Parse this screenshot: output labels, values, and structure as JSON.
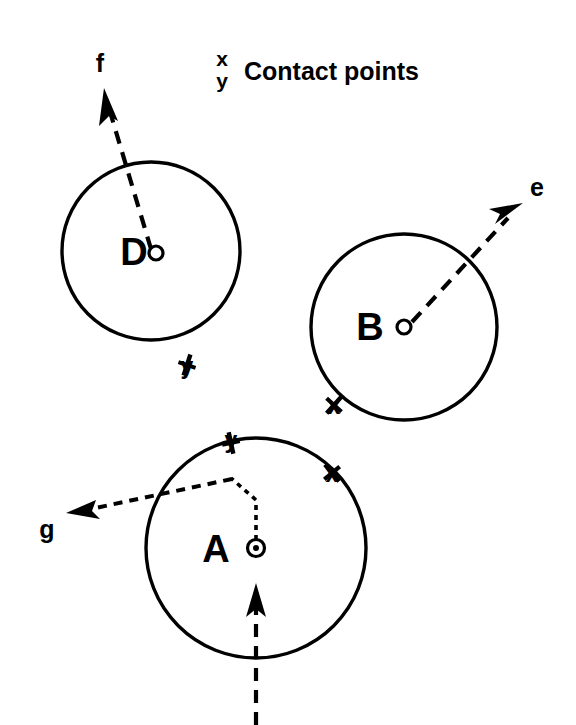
{
  "figure": {
    "background_color": "#ffffff",
    "ink_color": "#000000",
    "legend": {
      "key_x": "x",
      "key_y": "y",
      "caption": "Contact points"
    },
    "bodies": [
      {
        "id": "body-d",
        "label": "D",
        "center": {
          "x": 151,
          "y": 251
        },
        "radius": 89,
        "center_marker": "open-circle",
        "contact_marks": [
          {
            "label": "y",
            "x": 187,
            "y": 365
          }
        ],
        "force": {
          "label": "f",
          "label_x": 100,
          "label_y": 68,
          "from": {
            "x": 151,
            "y": 249
          },
          "to": {
            "x": 105,
            "y": 92
          },
          "style": "dashed"
        }
      },
      {
        "id": "body-b",
        "label": "B",
        "center": {
          "x": 404,
          "y": 327
        },
        "radius": 93,
        "center_marker": "open-circle",
        "contact_marks": [
          {
            "label": "x",
            "x": 334,
            "y": 405
          }
        ],
        "force": {
          "label": "e",
          "label_x": 537,
          "label_y": 194,
          "from": {
            "x": 406,
            "y": 326
          },
          "to": {
            "x": 521,
            "y": 206
          },
          "style": "dashed"
        }
      },
      {
        "id": "body-a",
        "label": "A",
        "center": {
          "x": 256,
          "y": 548
        },
        "radius": 110,
        "center_marker": "circle-with-dot",
        "contact_marks": [
          {
            "label": "y",
            "x": 231,
            "y": 444
          },
          {
            "label": "x",
            "x": 332,
            "y": 474
          }
        ],
        "force": {
          "label": "g",
          "label_x": 47,
          "label_y": 536,
          "from": {
            "x": 231,
            "y": 478
          },
          "to": {
            "x": 70,
            "y": 513
          },
          "style": "dashed"
        },
        "lever_path": "256,544 256,500 231,478",
        "input_force": {
          "label": "",
          "from": {
            "x": 256,
            "y": 725
          },
          "to": {
            "x": 256,
            "y": 586
          },
          "style": "dashed"
        }
      }
    ]
  }
}
